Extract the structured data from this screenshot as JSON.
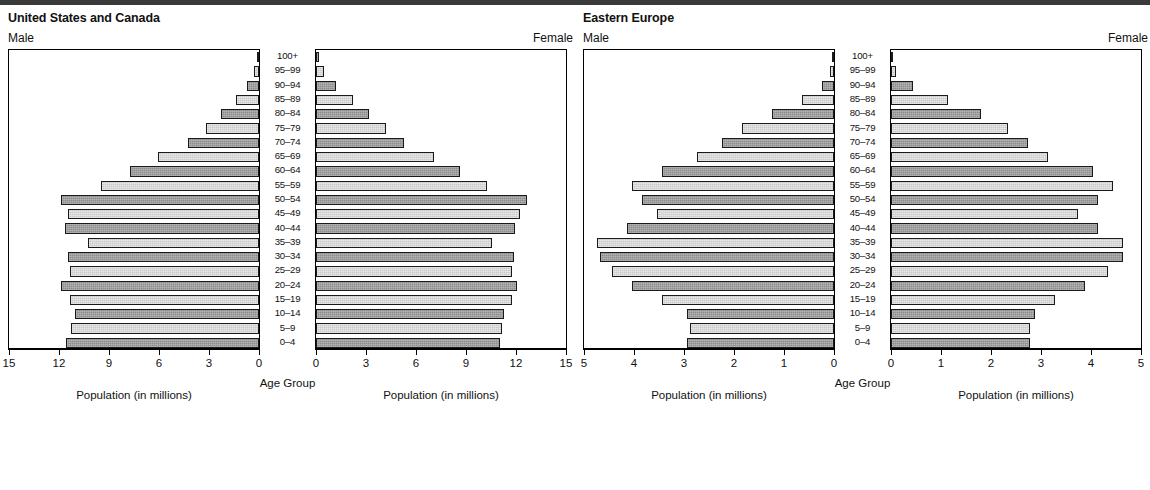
{
  "meta": {
    "header_rule_color": "#3a3a3a",
    "bar_dark_color": "#8d8d8d",
    "bar_light_color": "#c9c9c9",
    "axis_color": "#000000"
  },
  "panels": [
    {
      "key": "usca",
      "title": "United States and Canada",
      "male_label": "Male",
      "female_label": "Female",
      "age_group_caption": "Age Group",
      "left_caption": "Population (in millions)",
      "right_caption": "Population (in millions)",
      "left_ticks": [
        "15",
        "12",
        "9",
        "6",
        "3",
        "0"
      ],
      "right_ticks": [
        "0",
        "3",
        "6",
        "9",
        "12",
        "15"
      ]
    },
    {
      "key": "ee",
      "title": "Eastern Europe",
      "male_label": "Male",
      "female_label": "Female",
      "age_group_caption": "Age Group",
      "left_caption": "Population (in millions)",
      "right_caption": "Population (in millions)",
      "left_ticks": [
        "5",
        "4",
        "3",
        "2",
        "1",
        "0"
      ],
      "right_ticks": [
        "0",
        "1",
        "2",
        "3",
        "4",
        "5"
      ]
    }
  ],
  "age_groups": [
    "100+",
    "95–99",
    "90–94",
    "85–89",
    "80–84",
    "75–79",
    "70–74",
    "65–69",
    "60–64",
    "55–59",
    "50–54",
    "45–49",
    "40–44",
    "35–39",
    "30–34",
    "25–29",
    "20–24",
    "15–19",
    "10–14",
    "5–9",
    "0–4"
  ],
  "chart_data": [
    {
      "type": "bar",
      "title": "United States and Canada",
      "subtitle": "Population pyramid",
      "orientation": "horizontal-diverging",
      "xlabel": "Population (in millions)",
      "ylabel": "Age Group",
      "xlim": [
        0,
        15
      ],
      "xticks": [
        0,
        3,
        6,
        9,
        12,
        15
      ],
      "grid": false,
      "legend": [
        "Male",
        "Female"
      ],
      "legend_position": "top-outside",
      "categories": [
        "100+",
        "95–99",
        "90–94",
        "85–89",
        "80–84",
        "75–79",
        "70–74",
        "65–69",
        "60–64",
        "55–59",
        "50–54",
        "45–49",
        "40–44",
        "35–39",
        "30–34",
        "25–29",
        "20–24",
        "15–19",
        "10–14",
        "5–9",
        "0–4"
      ],
      "series": [
        {
          "name": "Male",
          "side": "left",
          "values": [
            0.1,
            0.3,
            0.7,
            1.4,
            2.3,
            3.2,
            4.3,
            6.1,
            7.8,
            9.5,
            11.9,
            11.5,
            11.7,
            10.3,
            11.5,
            11.4,
            11.9,
            11.4,
            11.1,
            11.3,
            11.6
          ]
        },
        {
          "name": "Female",
          "side": "right",
          "values": [
            0.2,
            0.5,
            1.2,
            2.2,
            3.2,
            4.2,
            5.3,
            7.1,
            8.7,
            10.3,
            12.7,
            12.3,
            12.0,
            10.6,
            11.9,
            11.8,
            12.1,
            11.8,
            11.3,
            11.2,
            11.1
          ]
        }
      ]
    },
    {
      "type": "bar",
      "title": "Eastern Europe",
      "subtitle": "Population pyramid",
      "orientation": "horizontal-diverging",
      "xlabel": "Population (in millions)",
      "ylabel": "Age Group",
      "xlim": [
        0,
        5
      ],
      "xticks": [
        0,
        1,
        2,
        3,
        4,
        5
      ],
      "grid": false,
      "legend": [
        "Male",
        "Female"
      ],
      "legend_position": "top-outside",
      "categories": [
        "100+",
        "95–99",
        "90–94",
        "85–89",
        "80–84",
        "75–79",
        "70–74",
        "65–69",
        "60–64",
        "55–59",
        "50–54",
        "45–49",
        "40–44",
        "35–39",
        "30–34",
        "25–29",
        "20–24",
        "15–19",
        "10–14",
        "5–9",
        "0–4"
      ],
      "series": [
        {
          "name": "Male",
          "side": "left",
          "values": [
            0.01,
            0.08,
            0.25,
            0.65,
            1.25,
            1.85,
            2.25,
            2.75,
            3.45,
            4.05,
            3.85,
            3.55,
            4.15,
            4.75,
            4.7,
            4.45,
            4.05,
            3.45,
            2.95,
            2.9,
            2.95
          ]
        },
        {
          "name": "Female",
          "side": "right",
          "values": [
            0.04,
            0.1,
            0.45,
            1.15,
            1.8,
            2.35,
            2.75,
            3.15,
            4.05,
            4.45,
            4.15,
            3.75,
            4.15,
            4.65,
            4.65,
            4.35,
            3.9,
            3.3,
            2.9,
            2.8,
            2.8
          ]
        }
      ]
    }
  ]
}
